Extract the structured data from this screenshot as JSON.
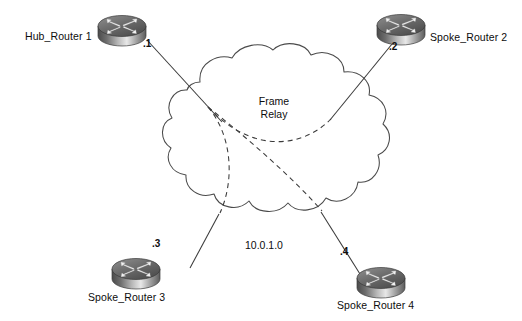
{
  "diagram": {
    "type": "network-topology",
    "title_text": "",
    "background_color": "#ffffff",
    "line_color": "#3a3a3a",
    "text_color": "#0d0d0d"
  },
  "cloud": {
    "name": "frame-relay-cloud",
    "label_line1": "Frame",
    "label_line2": "Relay",
    "network_label": "10.0.1.0",
    "outline_color": "#4a4a4a",
    "fill_color": "#ffffff"
  },
  "routers": [
    {
      "id": "hub-router-1",
      "label": "Hub_Router 1",
      "interface": ".1",
      "role": "hub",
      "position": "top-left"
    },
    {
      "id": "spoke-router-2",
      "label": "Spoke_Router 2",
      "interface": ".2",
      "role": "spoke",
      "position": "top-right"
    },
    {
      "id": "spoke-router-3",
      "label": "Spoke_Router 3",
      "interface": ".3",
      "role": "spoke",
      "position": "bottom-left"
    },
    {
      "id": "spoke-router-4",
      "label": "Spoke_Router 4",
      "interface": ".4",
      "role": "spoke",
      "position": "bottom-right"
    }
  ],
  "links": [
    {
      "id": "link-hub-cloud",
      "style": "solid",
      "from": "hub-router-1",
      "to": "frame-relay-cloud"
    },
    {
      "id": "link-spoke2-cloud",
      "style": "solid",
      "from": "spoke-router-2",
      "to": "frame-relay-cloud"
    },
    {
      "id": "link-spoke3-cloud",
      "style": "solid",
      "from": "spoke-router-3",
      "to": "frame-relay-cloud"
    },
    {
      "id": "link-spoke4-cloud",
      "style": "solid",
      "from": "spoke-router-4",
      "to": "frame-relay-cloud"
    }
  ],
  "pvcs": [
    {
      "id": "pvc-hub-spoke2",
      "style": "dashed",
      "from": "hub-router-1",
      "to": "spoke-router-2"
    },
    {
      "id": "pvc-hub-spoke3",
      "style": "dashed",
      "from": "hub-router-1",
      "to": "spoke-router-3"
    },
    {
      "id": "pvc-hub-spoke4",
      "style": "dashed",
      "from": "hub-router-1",
      "to": "spoke-router-4"
    }
  ]
}
